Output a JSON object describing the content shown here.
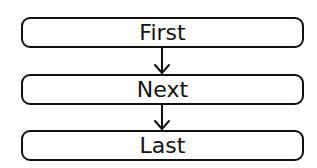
{
  "diagram": {
    "type": "flowchart",
    "nodes": [
      {
        "id": "first",
        "label": "First"
      },
      {
        "id": "next",
        "label": "Next"
      },
      {
        "id": "last",
        "label": "Last"
      }
    ],
    "edges": [
      {
        "from": "first",
        "to": "next"
      },
      {
        "from": "next",
        "to": "last"
      }
    ],
    "colors": {
      "stroke": "#111111",
      "background": "#ffffff"
    }
  }
}
